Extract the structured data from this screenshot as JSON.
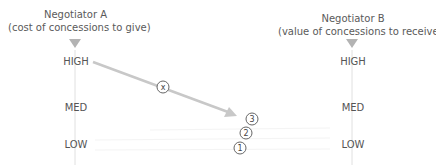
{
  "negotiator_a": {
    "name": "Negotiator A",
    "subtitle": "(cost of concessions to give)",
    "levels": [
      "HIGH",
      "MED",
      "LOW"
    ]
  },
  "negotiator_b": {
    "name": "Negotiator B",
    "subtitle": "(value of concessions to receive)",
    "levels": [
      "HIGH",
      "MED",
      "LOW"
    ]
  },
  "markers": {
    "x": "x",
    "three": "3",
    "two": "2",
    "one": "1"
  },
  "colors": {
    "axis": "#e0e0e0",
    "triangle": "#b3b3b3",
    "arrow": "#c8c8c8",
    "text": "#555555"
  }
}
